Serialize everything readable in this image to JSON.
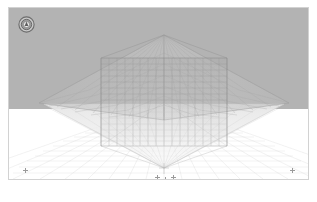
{
  "app": {
    "title": "3D Perspective Wireframe Viewport",
    "background_color": "#ffffff"
  },
  "viewport": {
    "label": "perspective-viewport",
    "border_color": "#d2d2d2",
    "sky_color": "#b3b3b3",
    "ground_color": "#ffffff",
    "horizon_y": 101,
    "width": 301,
    "height": 173
  },
  "gizmo": {
    "name": "view-orientation-gizmo",
    "ring_color": "#4a4a4a",
    "inner_color": "#d8d8d8",
    "tooltip": "View Cube"
  },
  "scene": {
    "name": "wireframe-scene",
    "wire_color": "#8d8d8d",
    "wire_color_light": "#c9c9c9",
    "ground_grid_color": "#d9d9d9",
    "objects": [
      {
        "name": "center-box-mesh",
        "type": "box",
        "left_x": 100,
        "right_x": 224,
        "top_y": 56,
        "bottom_y": 145,
        "subdivisions_u": 16,
        "subdivisions_v": 12
      },
      {
        "name": "upper-pyramid-wings",
        "type": "pyramid",
        "apex_x": 163,
        "apex_y": 34,
        "left_tip_x": 38,
        "left_tip_y": 100,
        "right_tip_x": 281,
        "right_tip_y": 101
      },
      {
        "name": "lower-pyramid-cone",
        "type": "pyramid-inverted",
        "tip_x": 163,
        "tip_y": 168
      },
      {
        "name": "ground-plane-grid",
        "type": "grid",
        "rows": 14,
        "columns": 22
      }
    ]
  },
  "markers": [
    {
      "name": "marker-left-anchor",
      "x": 16,
      "y": 163
    },
    {
      "name": "marker-right-anchor",
      "x": 283,
      "y": 163
    },
    {
      "name": "marker-pivot-center",
      "x": 160,
      "y": 172
    },
    {
      "name": "marker-pivot-left",
      "x": 152,
      "y": 170
    },
    {
      "name": "marker-pivot-right",
      "x": 168,
      "y": 170
    },
    {
      "name": "marker-pivot-lower",
      "x": 160,
      "y": 176
    }
  ]
}
